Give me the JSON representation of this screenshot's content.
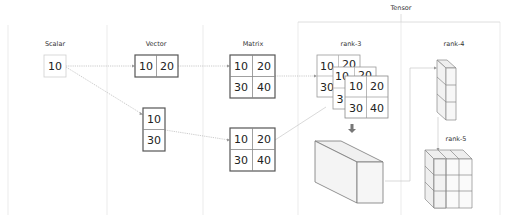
{
  "diagram": {
    "group_label": "Tensor",
    "columns": [
      {
        "id": "scalar",
        "label": "Scalar"
      },
      {
        "id": "vector",
        "label": "Vector"
      },
      {
        "id": "matrix",
        "label": "Matrix"
      },
      {
        "id": "rank3",
        "label": "rank-3"
      },
      {
        "id": "rank4",
        "label": "rank-4"
      },
      {
        "id": "rank5",
        "label": "rank-5"
      }
    ],
    "scalar": {
      "value": "10"
    },
    "vector_row": {
      "values": [
        "10",
        "20"
      ]
    },
    "vector_col": {
      "values": [
        "10",
        "30"
      ]
    },
    "matrix_top": {
      "values": [
        "10",
        "20",
        "30",
        "40"
      ]
    },
    "matrix_bottom": {
      "values": [
        "10",
        "20",
        "30",
        "40"
      ]
    },
    "rank3_stack": {
      "back": {
        "values": [
          "10",
          "20",
          "30"
        ]
      },
      "middle": {
        "values": [
          "10",
          "20",
          "3"
        ]
      },
      "front": {
        "values": [
          "10",
          "20",
          "30",
          "40"
        ]
      }
    },
    "down_arrow": "⬇",
    "colors": {
      "separator": "#e3e3e3",
      "box_border": "#555555",
      "connector": "#b8b8b8",
      "cube_face": "#f2f2f2",
      "cube_edge": "#777777"
    }
  }
}
